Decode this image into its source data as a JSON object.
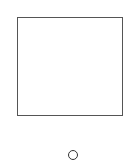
{
  "diagram": {
    "shapes": [
      {
        "type": "square",
        "label": "",
        "stroke": "#555555",
        "fill": "#ffffff"
      },
      {
        "type": "circle",
        "label": "",
        "stroke": "#333333",
        "fill": "#ffffff"
      }
    ],
    "background": "#ffffff"
  }
}
